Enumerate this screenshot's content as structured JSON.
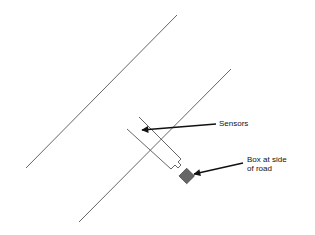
{
  "diagram": {
    "labels": {
      "sensors": "Sensors",
      "box_line1": "Box at side",
      "box_line2": "of road"
    },
    "colors": {
      "line": "#555555",
      "box_fill": "#666666",
      "arrow": "#111111"
    }
  }
}
